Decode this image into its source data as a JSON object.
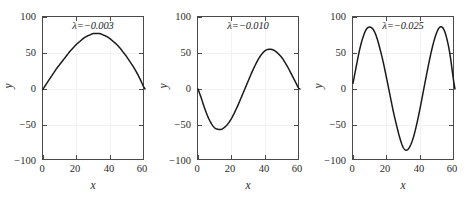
{
  "figure": {
    "panel_count": 3,
    "background_color": "#ffffff",
    "axis_color": "#4a4a4a",
    "curve_color": "#1a1a1a",
    "grid_color": "#f2f2f2"
  },
  "chart_data": [
    {
      "type": "line",
      "title": "λ=−0.003",
      "xlabel": "x",
      "ylabel": "y",
      "xlim": [
        0,
        61
      ],
      "ylim": [
        -100,
        100
      ],
      "xticks": [
        0,
        20,
        40,
        60
      ],
      "xticklabels": [
        "0",
        "20",
        "40",
        "60"
      ],
      "yticks": [
        -100,
        -50,
        0,
        50,
        100
      ],
      "yticklabels": [
        "−100",
        "−50",
        "0",
        "50",
        "100"
      ],
      "grid": true,
      "legend": "none",
      "annotation": "λ=−0.003",
      "lambda": -0.003,
      "x": [
        0,
        2,
        4,
        6,
        8,
        10,
        12,
        14,
        16,
        18,
        20,
        22,
        24,
        26,
        28,
        30,
        32,
        34,
        36,
        38,
        40,
        42,
        44,
        46,
        48,
        50,
        52,
        54,
        56,
        58,
        60,
        61
      ],
      "y": [
        0,
        7,
        14,
        21,
        28,
        34,
        40,
        46,
        52,
        57,
        62,
        66,
        70,
        73,
        75,
        77,
        77,
        77,
        75,
        73,
        70,
        66,
        62,
        57,
        51,
        45,
        38,
        31,
        23,
        14,
        4,
        0
      ]
    },
    {
      "type": "line",
      "title": "λ=−0.010",
      "xlabel": "x",
      "ylabel": "y",
      "xlim": [
        0,
        61
      ],
      "ylim": [
        -100,
        100
      ],
      "xticks": [
        0,
        20,
        40,
        60
      ],
      "xticklabels": [
        "0",
        "20",
        "40",
        "60"
      ],
      "yticks": [
        -100,
        -50,
        0,
        50,
        100
      ],
      "yticklabels": [
        "−100",
        "−50",
        "0",
        "50",
        "100"
      ],
      "grid": true,
      "legend": "none",
      "annotation": "λ=−0.010",
      "lambda": -0.01,
      "x": [
        0,
        2,
        4,
        6,
        8,
        10,
        12,
        14,
        16,
        18,
        20,
        22,
        24,
        26,
        28,
        30,
        32,
        34,
        36,
        38,
        40,
        42,
        44,
        46,
        48,
        50,
        52,
        54,
        56,
        58,
        60,
        61
      ],
      "y": [
        0,
        -13,
        -27,
        -39,
        -48,
        -54,
        -56,
        -56,
        -53,
        -48,
        -41,
        -32,
        -22,
        -11,
        0,
        11,
        22,
        32,
        41,
        48,
        53,
        55,
        55,
        53,
        49,
        44,
        37,
        29,
        20,
        11,
        2,
        0
      ]
    },
    {
      "type": "line",
      "title": "λ=−0.025",
      "xlabel": "x",
      "ylabel": "y",
      "xlim": [
        0,
        61
      ],
      "ylim": [
        -100,
        100
      ],
      "xticks": [
        0,
        20,
        40,
        60
      ],
      "xticklabels": [
        "0",
        "20",
        "40",
        "60"
      ],
      "yticks": [
        -100,
        -50,
        0,
        50,
        100
      ],
      "yticklabels": [
        "−100",
        "−50",
        "0",
        "50",
        "100"
      ],
      "grid": true,
      "legend": "none",
      "annotation": "λ=−0.025",
      "lambda": -0.025,
      "x": [
        0,
        2,
        4,
        6,
        8,
        10,
        12,
        14,
        16,
        18,
        20,
        22,
        24,
        26,
        28,
        30,
        32,
        34,
        36,
        38,
        40,
        42,
        44,
        46,
        48,
        50,
        52,
        54,
        56,
        58,
        60,
        61
      ],
      "y": [
        8,
        32,
        55,
        72,
        83,
        86,
        83,
        73,
        57,
        38,
        16,
        -7,
        -30,
        -50,
        -68,
        -81,
        -85,
        -80,
        -68,
        -50,
        -28,
        -4,
        20,
        43,
        63,
        78,
        86,
        84,
        71,
        48,
        14,
        0
      ]
    }
  ],
  "panels": [
    {
      "index": 0,
      "annotation": "λ=−0.003",
      "xlabel": "x",
      "ylabel": "y",
      "xticklabels": [
        "0",
        "20",
        "40",
        "60"
      ],
      "yticklabels": [
        "100",
        "50",
        "0",
        "−50",
        "−100"
      ]
    },
    {
      "index": 1,
      "annotation": "λ=−0.010",
      "xlabel": "x",
      "ylabel": "y",
      "xticklabels": [
        "0",
        "20",
        "40",
        "60"
      ],
      "yticklabels": [
        "100",
        "50",
        "0",
        "−50",
        "−100"
      ]
    },
    {
      "index": 2,
      "annotation": "λ=−0.025",
      "xlabel": "x",
      "ylabel": "y",
      "xticklabels": [
        "0",
        "20",
        "40",
        "60"
      ],
      "yticklabels": [
        "100",
        "50",
        "0",
        "−50",
        "−100"
      ]
    }
  ]
}
